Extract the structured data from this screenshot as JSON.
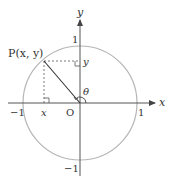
{
  "diagram": {
    "labels": {
      "x_axis": "x",
      "y_axis": "y",
      "origin": "O",
      "x_pos_one": "1",
      "x_neg_one": "−1",
      "y_pos_one": "1",
      "y_neg_one": "−1",
      "point_p": "P(x, y)",
      "proj_x": "x",
      "proj_y": "y",
      "angle": "θ"
    },
    "colors": {
      "circle": "#b0b0b0",
      "axes": "#555555",
      "radius": "#333333",
      "dashed": "#555555"
    }
  }
}
